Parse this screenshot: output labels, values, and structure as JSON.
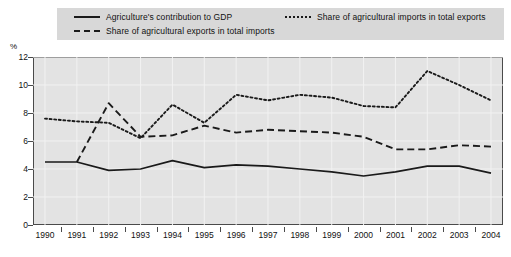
{
  "legend": {
    "items": [
      {
        "label": "Agriculture's contribution to GDP",
        "style": "solid",
        "key_icon": "solid-line-icon"
      },
      {
        "label": "Share of agricultural exports in total imports",
        "style": "dashed",
        "key_icon": "dashed-line-icon"
      },
      {
        "label": "Share of agricultural imports in total exports",
        "style": "dotted",
        "key_icon": "dotted-line-icon"
      }
    ]
  },
  "axis": {
    "y_unit": "%",
    "y_ticks": [
      "0",
      "2",
      "4",
      "6",
      "8",
      "10",
      "12"
    ],
    "x_ticks": [
      "1990",
      "1991",
      "1992",
      "1993",
      "1994",
      "1995",
      "1996",
      "1997",
      "1998",
      "1999",
      "2000",
      "2001",
      "2002",
      "2003",
      "2004"
    ]
  },
  "colors": {
    "line": "#1a1a1a",
    "plot_background": "#e3e3e3",
    "legend_background": "#d8d8d8",
    "axis": "#4a4a4a",
    "gridline": "#f2f2f2"
  },
  "chart_data": {
    "type": "line",
    "title": "",
    "subtitle": "",
    "xlabel": "",
    "ylabel": "%",
    "ylim": [
      0,
      12
    ],
    "ytick_step": 2,
    "grid": true,
    "legend_position": "top",
    "x": [
      1990,
      1991,
      1992,
      1993,
      1994,
      1995,
      1996,
      1997,
      1998,
      1999,
      2000,
      2001,
      2002,
      2003,
      2004
    ],
    "series": [
      {
        "name": "Agriculture's contribution to GDP",
        "style": "solid",
        "values": [
          4.5,
          4.5,
          3.9,
          4.0,
          4.6,
          4.1,
          4.3,
          4.2,
          4.0,
          3.8,
          3.5,
          3.8,
          4.2,
          4.2,
          3.7
        ]
      },
      {
        "name": "Share of agricultural exports in total imports",
        "style": "dashed",
        "values": [
          null,
          4.5,
          8.7,
          6.3,
          6.4,
          7.1,
          6.6,
          6.8,
          6.7,
          6.6,
          6.3,
          5.4,
          5.4,
          5.7,
          5.6
        ]
      },
      {
        "name": "Share of agricultural imports in total exports",
        "style": "dotted",
        "values": [
          7.6,
          7.4,
          7.3,
          6.2,
          8.6,
          7.3,
          9.3,
          8.9,
          9.3,
          9.1,
          8.5,
          8.4,
          11.0,
          10.0,
          8.9
        ]
      }
    ]
  }
}
